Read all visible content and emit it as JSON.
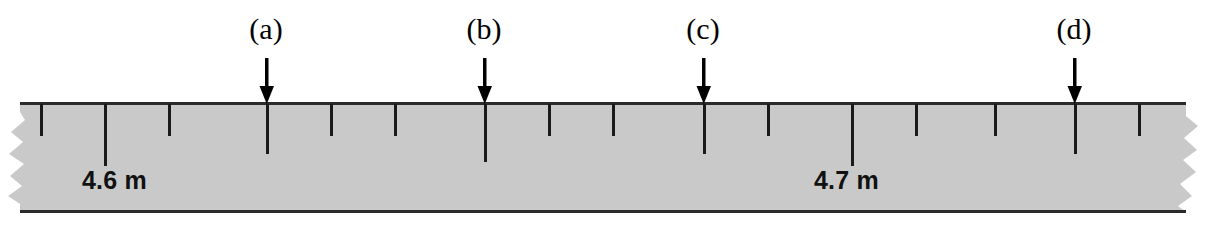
{
  "figure": {
    "kind": "measuring-tape-diagram",
    "background_color": "#ffffff",
    "tape": {
      "fill_color": "#c9c9c9",
      "edge_line_color": "#2b2b2b",
      "top_y": 103,
      "bottom_y": 213,
      "left_edge_style": "torn",
      "right_edge_style": "torn"
    },
    "ticks": [
      {
        "x": 40,
        "length": "short"
      },
      {
        "x": 104,
        "length": "long"
      },
      {
        "x": 168,
        "length": "short"
      },
      {
        "x": 266,
        "length": "long"
      },
      {
        "x": 330,
        "length": "short"
      },
      {
        "x": 394,
        "length": "short"
      },
      {
        "x": 484,
        "length": "extra-long"
      },
      {
        "x": 548,
        "length": "short"
      },
      {
        "x": 612,
        "length": "short"
      },
      {
        "x": 703,
        "length": "long"
      },
      {
        "x": 767,
        "length": "short"
      },
      {
        "x": 851,
        "length": "long"
      },
      {
        "x": 915,
        "length": "short"
      },
      {
        "x": 994,
        "length": "short"
      },
      {
        "x": 1074,
        "length": "long"
      },
      {
        "x": 1138,
        "length": "short"
      }
    ],
    "callouts": [
      {
        "id": "a",
        "label": "(a)",
        "label_x": 231,
        "label_y": 14,
        "arrow_x": 256,
        "arrow_y": 58,
        "tick_x": 266
      },
      {
        "id": "b",
        "label": "(b)",
        "label_x": 449,
        "label_y": 14,
        "arrow_x": 474,
        "arrow_y": 58,
        "tick_x": 484
      },
      {
        "id": "c",
        "label": "(c)",
        "label_x": 668,
        "label_y": 14,
        "arrow_x": 693,
        "arrow_y": 58,
        "tick_x": 703
      },
      {
        "id": "d",
        "label": "(d)",
        "label_x": 1039,
        "label_y": 14,
        "arrow_x": 1064,
        "arrow_y": 58,
        "tick_x": 1074
      }
    ],
    "distance_labels": [
      {
        "text": "4.6 m",
        "x": 82,
        "y": 166,
        "marks_tick_x": 104
      },
      {
        "text": "4.7 m",
        "x": 814,
        "y": 166,
        "marks_tick_x": 851
      }
    ]
  }
}
